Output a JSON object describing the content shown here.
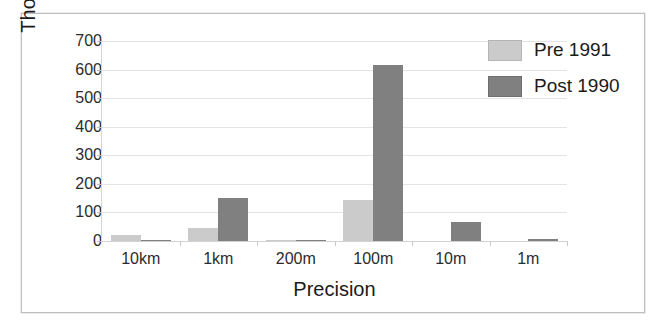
{
  "chart_data": {
    "type": "bar",
    "title": "",
    "xlabel": "Precision",
    "ylabel": "Thousands of records",
    "categories": [
      "10km",
      "1km",
      "200m",
      "100m",
      "10m",
      "1m"
    ],
    "series": [
      {
        "name": "Pre 1991",
        "color": "#cbcbcb",
        "values": [
          20,
          45,
          1,
          142,
          0,
          0
        ]
      },
      {
        "name": "Post 1990",
        "color": "#808080",
        "values": [
          3,
          150,
          5,
          615,
          65,
          8
        ]
      }
    ],
    "ylim": [
      0,
      700
    ],
    "yticks": [
      0,
      100,
      200,
      300,
      400,
      500,
      600,
      700
    ],
    "ytick_labels": [
      "0",
      "100",
      "200",
      "300",
      "400",
      "500",
      "600",
      "700"
    ],
    "grid": true,
    "legend_position": "top-right"
  },
  "legend": {
    "items": [
      {
        "label": "Pre 1991"
      },
      {
        "label": "Post 1990"
      }
    ]
  }
}
